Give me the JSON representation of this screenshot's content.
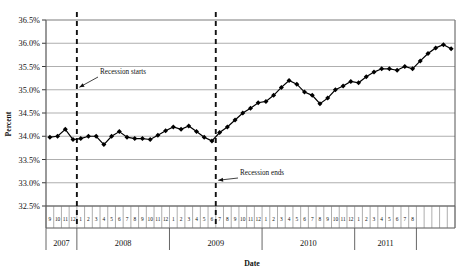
{
  "chart_data": {
    "type": "line",
    "title": "",
    "xlabel": "Date",
    "ylabel": "Percent",
    "ylim": [
      32.5,
      36.5
    ],
    "ytick_step": 0.5,
    "ytick_labels": [
      "32.5%",
      "33.0%",
      "33.5%",
      "34.0%",
      "34.5%",
      "35.0%",
      "35.5%",
      "36.0%",
      "36.5%"
    ],
    "ytick_values": [
      32.5,
      33.0,
      33.5,
      34.0,
      34.5,
      35.0,
      35.5,
      36.0,
      36.5
    ],
    "grid": "horizontal",
    "legend": "none",
    "series_color": "#000000",
    "marker": "diamond",
    "x_months": [
      "9",
      "10",
      "11",
      "12",
      "1",
      "2",
      "3",
      "4",
      "5",
      "6",
      "7",
      "8",
      "9",
      "10",
      "11",
      "12",
      "1",
      "2",
      "3",
      "4",
      "5",
      "6",
      "7",
      "8",
      "9",
      "10",
      "11",
      "12",
      "1",
      "2",
      "3",
      "4",
      "5",
      "6",
      "7",
      "8",
      "9",
      "10",
      "11",
      "12",
      "1",
      "2",
      "3",
      "4",
      "5",
      "6",
      "7",
      "8"
    ],
    "x_year_groups": [
      {
        "label": "2007",
        "start_index": 0,
        "count": 4
      },
      {
        "label": "2008",
        "start_index": 4,
        "count": 12
      },
      {
        "label": "2009",
        "start_index": 16,
        "count": 12
      },
      {
        "label": "2010",
        "start_index": 28,
        "count": 12
      },
      {
        "label": "2011",
        "start_index": 40,
        "count": 8
      }
    ],
    "x": [
      "2007-09",
      "2007-10",
      "2007-11",
      "2007-12",
      "2008-01",
      "2008-02",
      "2008-03",
      "2008-04",
      "2008-05",
      "2008-06",
      "2008-07",
      "2008-08",
      "2008-09",
      "2008-10",
      "2008-11",
      "2008-12",
      "2009-01",
      "2009-02",
      "2009-03",
      "2009-04",
      "2009-05",
      "2009-06",
      "2009-07",
      "2009-08",
      "2009-09",
      "2009-10",
      "2009-11",
      "2009-12",
      "2010-01",
      "2010-02",
      "2010-03",
      "2010-04",
      "2010-05",
      "2010-06",
      "2010-07",
      "2010-08",
      "2010-09",
      "2010-10",
      "2010-11",
      "2010-12",
      "2011-01",
      "2011-02",
      "2011-03",
      "2011-04",
      "2011-05",
      "2011-06",
      "2011-07",
      "2011-08"
    ],
    "values": [
      33.98,
      34.0,
      34.15,
      33.93,
      33.95,
      34.0,
      34.0,
      33.82,
      34.0,
      34.1,
      33.98,
      33.95,
      33.95,
      33.93,
      34.02,
      34.12,
      34.2,
      34.15,
      34.22,
      34.1,
      33.98,
      33.9,
      34.08,
      34.2,
      34.35,
      34.5,
      34.6,
      34.72,
      34.75,
      34.88,
      35.05,
      35.2,
      35.12,
      34.95,
      34.88,
      34.7,
      34.82,
      35.0,
      35.08,
      35.18,
      35.15,
      35.28,
      35.38,
      35.45,
      35.45,
      35.42,
      35.5,
      35.45
    ],
    "values_tail": [
      35.62,
      35.78,
      35.9,
      35.97,
      35.88
    ],
    "annotations": [
      {
        "name": "recession-starts",
        "text": "Recession starts",
        "line_x_index": 3,
        "arrow_target_value": 35.0,
        "text_x": 100,
        "text_y": 74
      },
      {
        "name": "recession-ends",
        "text": "Recession ends",
        "line_x_index": 21,
        "arrow_target_value": 33.0,
        "text_x": 240,
        "text_y": 175
      }
    ]
  }
}
